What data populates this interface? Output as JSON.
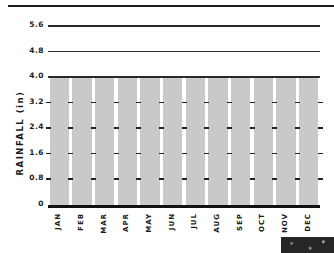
{
  "chart_data": {
    "type": "bar",
    "title": "",
    "xlabel": "",
    "ylabel": "RAINFALL (in)",
    "categories": [
      "JAN",
      "FEB",
      "MAR",
      "APR",
      "MAY",
      "JUN",
      "JUL",
      "AUG",
      "SEP",
      "OCT",
      "NOV",
      "DEC"
    ],
    "values": [
      4.0,
      4.0,
      4.0,
      4.0,
      4.0,
      4.0,
      4.0,
      4.0,
      4.0,
      4.0,
      4.0,
      4.0
    ],
    "ylim": [
      0,
      5.6
    ],
    "yticks": [
      "0",
      "0.8",
      "1.6",
      "2.4",
      "3.2",
      "4.0",
      "4.8",
      "5.6"
    ],
    "grid": true,
    "legend": null,
    "colors": {
      "bar": "#c9c9c9",
      "gridline": "#2a2a2a",
      "text": "#1a1a1a"
    }
  },
  "axis": {
    "ylabel": "RAINFALL (in)",
    "yticks": [
      "0",
      "0.8",
      "1.6",
      "2.4",
      "3.2",
      "4.0",
      "4.8",
      "5.6"
    ],
    "months": [
      "JAN",
      "FEB",
      "MAR",
      "APR",
      "MAY",
      "JUN",
      "JUL",
      "AUG",
      "SEP",
      "OCT",
      "NOV",
      "DEC"
    ]
  }
}
